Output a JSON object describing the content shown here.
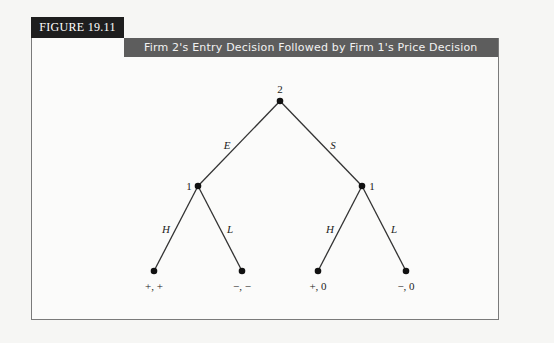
{
  "figure": {
    "label": "FIGURE 19.11",
    "title": "Firm 2's Entry Decision Followed by Firm 1's Price Decision"
  },
  "tree": {
    "root": {
      "player": "2"
    },
    "branches_root": [
      {
        "label": "E"
      },
      {
        "label": "S"
      }
    ],
    "nodes": [
      {
        "player": "1"
      },
      {
        "player": "1"
      }
    ],
    "branches_left": [
      {
        "label": "H"
      },
      {
        "label": "L"
      }
    ],
    "branches_right": [
      {
        "label": "H"
      },
      {
        "label": "L"
      }
    ],
    "payoffs": [
      "+, +",
      "−, −",
      "+, 0",
      "−, 0"
    ]
  },
  "colors": {
    "tab": "#1e1e1e",
    "title_bar": "#5d5d5d",
    "line": "#333333"
  }
}
